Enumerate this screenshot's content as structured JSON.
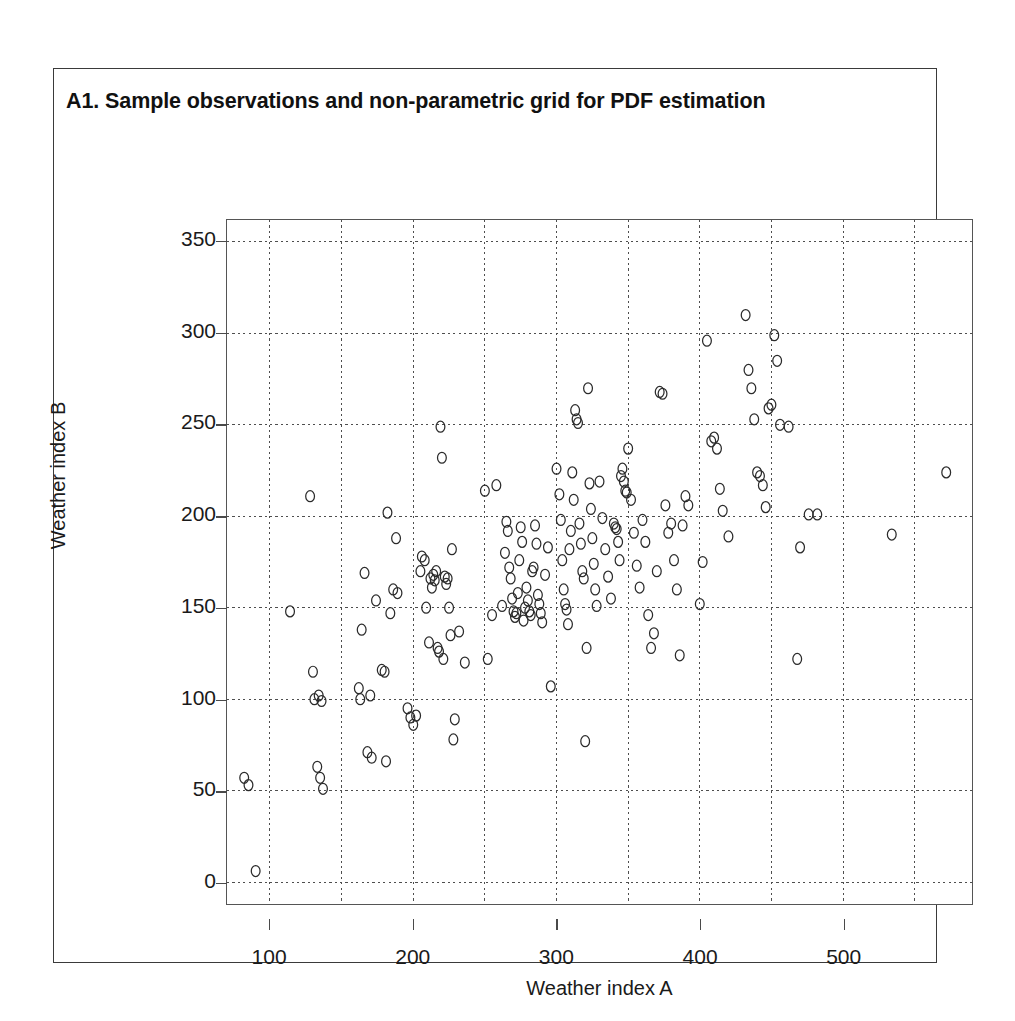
{
  "figure": {
    "title": "A1.  Sample observations and non-parametric grid for PDF estimation"
  },
  "chart_data": {
    "type": "scatter",
    "title": "A1.  Sample observations and non-parametric grid for PDF estimation",
    "xlabel": "Weather index A",
    "ylabel": "Weather index B",
    "xlim": [
      70,
      590
    ],
    "ylim": [
      -12,
      362
    ],
    "xticks": [
      100,
      200,
      300,
      400,
      500
    ],
    "xtick_labels": [
      "100",
      "200",
      "300",
      "400",
      "500"
    ],
    "yticks": [
      0,
      50,
      100,
      150,
      200,
      250,
      300,
      350
    ],
    "ytick_labels": [
      "0",
      "50",
      "100",
      "150",
      "200",
      "250",
      "300",
      "350"
    ],
    "grid": true,
    "grid_style": "dotted",
    "grid_x_values": [
      100,
      150,
      200,
      250,
      300,
      350,
      400,
      450,
      500,
      550
    ],
    "grid_y_values": [
      0,
      50,
      100,
      150,
      200,
      250,
      300,
      350
    ],
    "marker": "open-circle",
    "marker_color": "#2b2b2b",
    "marker_size": 11,
    "legend": null,
    "n_points": 184,
    "points": [
      [
        82,
        57
      ],
      [
        85,
        53
      ],
      [
        90,
        6
      ],
      [
        114,
        148
      ],
      [
        128,
        211
      ],
      [
        130,
        115
      ],
      [
        131,
        100
      ],
      [
        133,
        63
      ],
      [
        134,
        102
      ],
      [
        135,
        57
      ],
      [
        136,
        99
      ],
      [
        137,
        51
      ],
      [
        162,
        106
      ],
      [
        163,
        100
      ],
      [
        164,
        138
      ],
      [
        166,
        169
      ],
      [
        168,
        71
      ],
      [
        170,
        102
      ],
      [
        171,
        68
      ],
      [
        174,
        154
      ],
      [
        178,
        116
      ],
      [
        180,
        115
      ],
      [
        181,
        66
      ],
      [
        182,
        202
      ],
      [
        184,
        147
      ],
      [
        186,
        160
      ],
      [
        188,
        188
      ],
      [
        189,
        158
      ],
      [
        196,
        95
      ],
      [
        198,
        90
      ],
      [
        200,
        86
      ],
      [
        202,
        91
      ],
      [
        205,
        170
      ],
      [
        206,
        178
      ],
      [
        208,
        176
      ],
      [
        209,
        150
      ],
      [
        211,
        131
      ],
      [
        212,
        166
      ],
      [
        213,
        161
      ],
      [
        214,
        168
      ],
      [
        215,
        165
      ],
      [
        216,
        170
      ],
      [
        217,
        128
      ],
      [
        218,
        126
      ],
      [
        219,
        249
      ],
      [
        220,
        232
      ],
      [
        221,
        122
      ],
      [
        222,
        167
      ],
      [
        223,
        163
      ],
      [
        224,
        166
      ],
      [
        225,
        150
      ],
      [
        226,
        135
      ],
      [
        227,
        182
      ],
      [
        228,
        78
      ],
      [
        229,
        89
      ],
      [
        232,
        137
      ],
      [
        236,
        120
      ],
      [
        250,
        214
      ],
      [
        252,
        122
      ],
      [
        255,
        146
      ],
      [
        258,
        217
      ],
      [
        262,
        151
      ],
      [
        264,
        180
      ],
      [
        265,
        197
      ],
      [
        266,
        192
      ],
      [
        267,
        172
      ],
      [
        268,
        166
      ],
      [
        269,
        155
      ],
      [
        270,
        148
      ],
      [
        271,
        145
      ],
      [
        272,
        147
      ],
      [
        273,
        158
      ],
      [
        274,
        176
      ],
      [
        275,
        194
      ],
      [
        276,
        186
      ],
      [
        277,
        143
      ],
      [
        278,
        150
      ],
      [
        279,
        161
      ],
      [
        280,
        154
      ],
      [
        281,
        148
      ],
      [
        282,
        146
      ],
      [
        283,
        170
      ],
      [
        284,
        172
      ],
      [
        285,
        195
      ],
      [
        286,
        185
      ],
      [
        287,
        157
      ],
      [
        288,
        152
      ],
      [
        289,
        147
      ],
      [
        290,
        142
      ],
      [
        292,
        168
      ],
      [
        294,
        183
      ],
      [
        296,
        107
      ],
      [
        300,
        226
      ],
      [
        302,
        212
      ],
      [
        303,
        198
      ],
      [
        304,
        176
      ],
      [
        305,
        160
      ],
      [
        306,
        152
      ],
      [
        307,
        149
      ],
      [
        308,
        141
      ],
      [
        309,
        182
      ],
      [
        310,
        192
      ],
      [
        311,
        224
      ],
      [
        312,
        209
      ],
      [
        313,
        258
      ],
      [
        314,
        253
      ],
      [
        315,
        251
      ],
      [
        316,
        196
      ],
      [
        317,
        185
      ],
      [
        318,
        170
      ],
      [
        319,
        166
      ],
      [
        320,
        77
      ],
      [
        321,
        128
      ],
      [
        322,
        270
      ],
      [
        323,
        218
      ],
      [
        324,
        204
      ],
      [
        325,
        188
      ],
      [
        326,
        174
      ],
      [
        327,
        160
      ],
      [
        328,
        151
      ],
      [
        330,
        219
      ],
      [
        332,
        199
      ],
      [
        334,
        182
      ],
      [
        336,
        167
      ],
      [
        338,
        155
      ],
      [
        340,
        196
      ],
      [
        341,
        194
      ],
      [
        342,
        193
      ],
      [
        343,
        186
      ],
      [
        344,
        176
      ],
      [
        345,
        222
      ],
      [
        346,
        226
      ],
      [
        347,
        219
      ],
      [
        348,
        214
      ],
      [
        349,
        213
      ],
      [
        350,
        237
      ],
      [
        352,
        209
      ],
      [
        354,
        191
      ],
      [
        356,
        173
      ],
      [
        358,
        161
      ],
      [
        360,
        198
      ],
      [
        362,
        186
      ],
      [
        364,
        146
      ],
      [
        366,
        128
      ],
      [
        368,
        136
      ],
      [
        370,
        170
      ],
      [
        372,
        268
      ],
      [
        374,
        267
      ],
      [
        376,
        206
      ],
      [
        378,
        191
      ],
      [
        380,
        196
      ],
      [
        382,
        176
      ],
      [
        384,
        160
      ],
      [
        386,
        124
      ],
      [
        388,
        195
      ],
      [
        390,
        211
      ],
      [
        392,
        206
      ],
      [
        400,
        152
      ],
      [
        402,
        175
      ],
      [
        405,
        296
      ],
      [
        408,
        241
      ],
      [
        410,
        243
      ],
      [
        412,
        237
      ],
      [
        414,
        215
      ],
      [
        416,
        203
      ],
      [
        420,
        189
      ],
      [
        432,
        310
      ],
      [
        434,
        280
      ],
      [
        436,
        270
      ],
      [
        438,
        253
      ],
      [
        440,
        224
      ],
      [
        442,
        222
      ],
      [
        444,
        217
      ],
      [
        446,
        205
      ],
      [
        448,
        259
      ],
      [
        450,
        261
      ],
      [
        452,
        299
      ],
      [
        454,
        285
      ],
      [
        456,
        250
      ],
      [
        462,
        249
      ],
      [
        468,
        122
      ],
      [
        470,
        183
      ],
      [
        476,
        201
      ],
      [
        482,
        201
      ],
      [
        534,
        190
      ],
      [
        572,
        224
      ]
    ]
  },
  "axes": {
    "x": {
      "label": "Weather index A",
      "ticks": [
        "100",
        "200",
        "300",
        "400",
        "500"
      ]
    },
    "y": {
      "label": "Weather index B",
      "ticks": [
        "0",
        "50",
        "100",
        "150",
        "200",
        "250",
        "300",
        "350"
      ]
    }
  }
}
